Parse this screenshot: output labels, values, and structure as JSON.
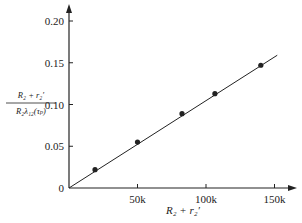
{
  "chart_data": {
    "type": "scatter",
    "title": "",
    "xlabel": "R2 + r2'",
    "ylabel": "(R2 + r2') / (R2 λ12(τp))",
    "ylabel_numerator": "R₂ + r₂′",
    "ylabel_denominator": "R₂λ₁₂(τₚ)",
    "xlabel_display": "R₂ + r₂′",
    "xlim": [
      0,
      165000
    ],
    "ylim": [
      0,
      0.22
    ],
    "x_ticks": [
      0,
      50000,
      100000,
      150000
    ],
    "x_tick_labels": [
      "",
      "50k",
      "100k",
      "150k"
    ],
    "y_ticks": [
      0,
      0.05,
      0.1,
      0.15,
      0.2
    ],
    "y_tick_labels": [
      "0",
      "0.05",
      "0.10",
      "0.15",
      "0.20"
    ],
    "origin_label": "0",
    "grid": false,
    "legend": null,
    "series": [
      {
        "name": "measured",
        "type": "scatter",
        "x": [
          19000,
          50000,
          82500,
          106500,
          140000
        ],
        "y": [
          0.022,
          0.055,
          0.089,
          0.113,
          0.147
        ]
      },
      {
        "name": "fit line",
        "type": "line",
        "x": [
          0,
          152000
        ],
        "y": [
          0,
          0.159
        ]
      }
    ]
  },
  "colors": {
    "ink": "#222222",
    "background": "#ffffff"
  }
}
